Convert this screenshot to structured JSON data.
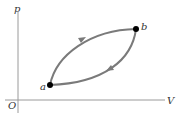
{
  "diagram": {
    "title": "",
    "axes": {
      "y_label": "p",
      "x_label": "V",
      "origin_label": "O"
    },
    "points": [
      {
        "id": "a",
        "label": "a",
        "x": 50,
        "y": 85
      },
      {
        "id": "b",
        "label": "b",
        "x": 136,
        "y": 29
      }
    ],
    "paths": [
      {
        "id": "upper",
        "from": "a",
        "to": "b",
        "direction": "a-to-b"
      },
      {
        "id": "lower",
        "from": "b",
        "to": "a",
        "direction": "b-to-a"
      }
    ],
    "colors": {
      "curve": "#7a7a7a",
      "axis": "#9a9a9a",
      "point": "#000000",
      "label": "#333333"
    }
  }
}
